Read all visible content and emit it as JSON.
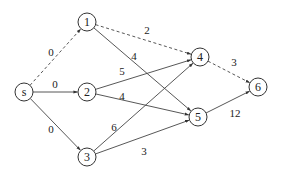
{
  "graph": {
    "nodes": [
      {
        "id": "s",
        "label": "s",
        "x": 24,
        "y": 92
      },
      {
        "id": "1",
        "label": "1",
        "x": 87,
        "y": 22
      },
      {
        "id": "2",
        "label": "2",
        "x": 87,
        "y": 92
      },
      {
        "id": "3",
        "label": "3",
        "x": 87,
        "y": 157
      },
      {
        "id": "4",
        "label": "4",
        "x": 200,
        "y": 57
      },
      {
        "id": "5",
        "label": "5",
        "x": 198,
        "y": 117
      },
      {
        "id": "6",
        "label": "6",
        "x": 258,
        "y": 87
      }
    ],
    "edges": [
      {
        "from": "s",
        "to": "1",
        "weight": "0",
        "dashed": true,
        "lx": 51,
        "ly": 52
      },
      {
        "from": "s",
        "to": "2",
        "weight": "0",
        "dashed": false,
        "lx": 55,
        "ly": 84
      },
      {
        "from": "s",
        "to": "3",
        "weight": "0",
        "dashed": false,
        "lx": 51,
        "ly": 129
      },
      {
        "from": "1",
        "to": "4",
        "weight": "2",
        "dashed": true,
        "lx": 147,
        "ly": 30
      },
      {
        "from": "1",
        "to": "5",
        "weight": "4",
        "dashed": false,
        "lx": 134,
        "ly": 56
      },
      {
        "from": "2",
        "to": "4",
        "weight": "5",
        "dashed": false,
        "lx": 122,
        "ly": 71
      },
      {
        "from": "2",
        "to": "5",
        "weight": "4",
        "dashed": false,
        "lx": 122,
        "ly": 96
      },
      {
        "from": "3",
        "to": "4",
        "weight": "6",
        "dashed": false,
        "lx": 114,
        "ly": 127
      },
      {
        "from": "3",
        "to": "5",
        "weight": "3",
        "dashed": false,
        "lx": 144,
        "ly": 151
      },
      {
        "from": "4",
        "to": "6",
        "weight": "3",
        "dashed": true,
        "lx": 234,
        "ly": 62
      },
      {
        "from": "5",
        "to": "6",
        "weight": "12",
        "dashed": false,
        "lx": 235,
        "ly": 113
      }
    ]
  }
}
